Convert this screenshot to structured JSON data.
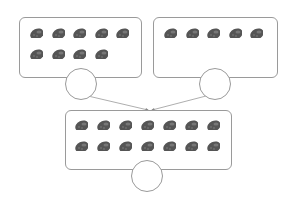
{
  "diagram": {
    "type": "addition-counting",
    "item_icon": "strawberry-icon",
    "item_color": "#555555",
    "border_color": "#9a9a9a",
    "groups": [
      {
        "name": "left-group",
        "count": 9,
        "rows": [
          5,
          4
        ],
        "answer": ""
      },
      {
        "name": "right-group",
        "count": 5,
        "rows": [
          5
        ],
        "answer": ""
      },
      {
        "name": "total-group",
        "count": 14,
        "rows": [
          7,
          7
        ],
        "answer": ""
      }
    ]
  }
}
